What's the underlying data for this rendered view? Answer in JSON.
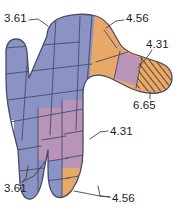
{
  "figure": {
    "background_color": "#ffffff",
    "outline_color": "#3a3a5a"
  },
  "palette": {
    "blue_violet": "#8b93c4",
    "orange": "#e8a868",
    "mauve": "#b894b8",
    "hatch_base": "#e8a868",
    "hatch_line": "#4a3a28",
    "outline": "#4a4a6a",
    "leader_line": "#3a3a3a",
    "text": "#1a1a1a"
  },
  "legend_values": {
    "blue_violet": "3.61",
    "orange": "4.56",
    "mauve": "4.31",
    "hatched": "6.65"
  },
  "labels": [
    {
      "id": "top-left",
      "value": "3.61",
      "zone": "ulnar-palm",
      "color_key": "blue_violet",
      "position": "top-left"
    },
    {
      "id": "top-right",
      "value": "4.56",
      "zone": "radial-palm",
      "color_key": "orange",
      "position": "top-right"
    },
    {
      "id": "thumb-middle",
      "value": "4.31",
      "zone": "thumb-proximal-phalanx",
      "color_key": "mauve",
      "position": "right-upper"
    },
    {
      "id": "thumb-tip",
      "value": "6.65",
      "zone": "thumb-distal-tip",
      "color_key": "hatched",
      "position": "right-lower"
    },
    {
      "id": "middle-finger",
      "value": "4.31",
      "zone": "middle-finger-phalanx",
      "color_key": "mauve",
      "position": "center-right"
    },
    {
      "id": "bottom-left",
      "value": "3.61",
      "zone": "little-and-ring-fingertips",
      "color_key": "blue_violet",
      "position": "bottom-left"
    },
    {
      "id": "bottom-right",
      "value": "4.56",
      "zone": "index-and-middle-fingertips",
      "color_key": "orange",
      "position": "bottom-right"
    }
  ]
}
